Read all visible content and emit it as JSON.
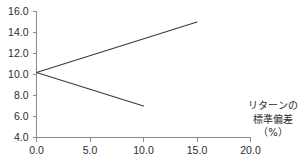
{
  "chart_data": {
    "type": "line",
    "title": "",
    "subtitle": "",
    "xlabel": "",
    "ylabel": "",
    "axis_caption_lines": [
      "リターンの",
      "標準偏差",
      "（%）"
    ],
    "xlim": [
      0.0,
      20.0
    ],
    "ylim": [
      4.0,
      16.0
    ],
    "xticks": [
      0.0,
      5.0,
      10.0,
      15.0,
      20.0
    ],
    "yticks": [
      4.0,
      6.0,
      8.0,
      10.0,
      12.0,
      14.0,
      16.0
    ],
    "xtick_labels": [
      "0.0",
      "5.0",
      "10.0",
      "15.0",
      "20.0"
    ],
    "ytick_labels": [
      "4.0",
      "6.0",
      "8.0",
      "10.0",
      "12.0",
      "14.0",
      "16.0"
    ],
    "grid": false,
    "legend": null,
    "legend_position": "none",
    "line_color": "#3a3a3a",
    "axis_color": "#8a8a8a",
    "series": [
      {
        "name": "upper-branch",
        "x": [
          0.0,
          15.0
        ],
        "values": [
          10.2,
          15.0
        ]
      },
      {
        "name": "lower-branch",
        "x": [
          0.0,
          10.0
        ],
        "values": [
          10.2,
          7.0
        ]
      }
    ],
    "annotations": []
  },
  "axis_caption": {
    "line1": "リターンの",
    "line2": "標準偏差",
    "line3": "（%）"
  }
}
